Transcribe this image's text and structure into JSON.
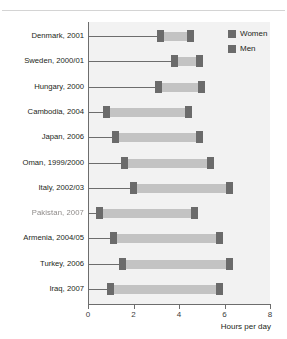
{
  "title": "selected countries",
  "legend": {
    "position": "top-right",
    "entries": [
      {
        "label": "Women",
        "color": "#6b6b6b",
        "icon": "square-swatch"
      },
      {
        "label": "Men",
        "color": "#6b6b6b",
        "icon": "square-swatch"
      }
    ]
  },
  "axis": {
    "x_label": "Hours per day",
    "x_ticks": [
      "0",
      "2",
      "4",
      "6",
      "8"
    ]
  },
  "colors": {
    "marker": "#6b6b6b",
    "span": "#c3c3c3",
    "plot_background": "#f2f2f2",
    "axis": "#6d6d6d",
    "text": "#231f20"
  },
  "chart_data": {
    "type": "bar",
    "subtype": "dumbbell-range",
    "title": "selected countries",
    "xlabel": "Hours per day",
    "ylabel": "",
    "xlim": [
      0,
      8
    ],
    "xticks": [
      0,
      2,
      4,
      6,
      8
    ],
    "grid": false,
    "legend": [
      "Women",
      "Men"
    ],
    "categories": [
      "Denmark, 2001",
      "Sweden, 2000/01",
      "Hungary, 2000",
      "Cambodia, 2004",
      "Japan, 2006",
      "Oman, 1999/2000",
      "Italy, 2002/03",
      "Pakistan, 2007",
      "Armenia, 2004/05",
      "Turkey, 2006",
      "Iraq, 2007"
    ],
    "series": [
      {
        "name": "Men",
        "values": [
          3.2,
          3.8,
          3.1,
          0.8,
          1.2,
          1.6,
          2.0,
          0.5,
          1.1,
          1.5,
          1.0
        ]
      },
      {
        "name": "Women",
        "values": [
          4.5,
          4.9,
          5.0,
          4.4,
          4.9,
          5.4,
          6.2,
          4.7,
          5.8,
          6.2,
          5.8
        ]
      }
    ],
    "rows": [
      {
        "label": "Denmark, 2001",
        "men": 3.2,
        "women": 4.5
      },
      {
        "label": "Sweden, 2000/01",
        "men": 3.8,
        "women": 4.9
      },
      {
        "label": "Hungary, 2000",
        "men": 3.1,
        "women": 5.0
      },
      {
        "label": "Cambodia, 2004",
        "men": 0.8,
        "women": 4.4
      },
      {
        "label": "Japan, 2006",
        "men": 1.2,
        "women": 4.9
      },
      {
        "label": "Oman, 1999/2000",
        "men": 1.6,
        "women": 5.4
      },
      {
        "label": "Italy, 2002/03",
        "men": 2.0,
        "women": 6.2
      },
      {
        "label": "Pakistan, 2007",
        "men": 0.5,
        "women": 4.7,
        "label_degraded": true
      },
      {
        "label": "Armenia, 2004/05",
        "men": 1.1,
        "women": 5.8
      },
      {
        "label": "Turkey, 2006",
        "men": 1.5,
        "women": 6.2
      },
      {
        "label": "Iraq, 2007",
        "men": 1.0,
        "women": 5.8
      }
    ]
  }
}
